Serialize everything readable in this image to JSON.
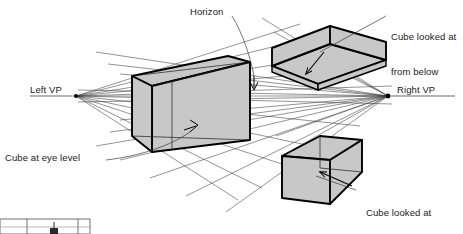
{
  "figure": {
    "background_color": "#ffffff",
    "face_fill_color": "#c8c8c8",
    "outline_color": "#000000",
    "construction_line_color": "#4d4d4d",
    "horizon_line_color": "#8c8c8c",
    "text_color": "#1a1a1a"
  },
  "labels": {
    "horizon": "Horizon",
    "left_vp": "Left VP",
    "right_vp": "Right VP",
    "cube_below": "Cube looked at\nfrom below",
    "cube_below_line1": "Cube looked at",
    "cube_below_line2": "from below",
    "cube_eye_level": "Cube at eye level",
    "cube_above_line1": "Cube looked at",
    "cube_above_line2": "from above"
  },
  "vanishing_points": {
    "left": {
      "label": "Left VP",
      "x": 76,
      "y": 96
    },
    "right": {
      "label": "Right VP",
      "x": 388,
      "y": 96
    }
  },
  "horizon": {
    "label": "Horizon",
    "y": 96,
    "from_x": 30,
    "to_x": 455
  },
  "objects": [
    {
      "name": "cube-above-eye-level",
      "label": "Cube looked at from below",
      "position": "upper-right",
      "view": "from below"
    },
    {
      "name": "cube-at-eye-level",
      "label": "Cube at eye level",
      "position": "center",
      "view": "eye level"
    },
    {
      "name": "cube-below-eye-level",
      "label": "Cube looked at from above",
      "position": "lower-right",
      "view": "from above"
    }
  ],
  "figure_fragment": {
    "name": "next-figure-fragment",
    "description": "cropped top edge of a following diagram at bottom-left"
  }
}
